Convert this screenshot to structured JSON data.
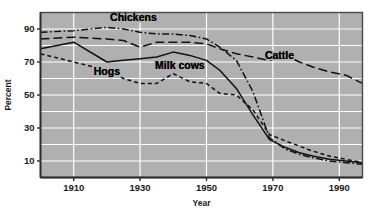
{
  "chart_data": {
    "type": "line",
    "title": "",
    "xlabel": "Year",
    "ylabel": "Percent",
    "xlim": [
      1900,
      1997
    ],
    "ylim": [
      0,
      100
    ],
    "grid": true,
    "grid_color": "#ffffff",
    "plot_background": "#b0b0b0",
    "legend": "inline-labels",
    "x_ticks": [
      "1910",
      "1930",
      "1950",
      "1970",
      "1990"
    ],
    "x_tick_values": [
      1910,
      1930,
      1950,
      1970,
      1990
    ],
    "y_ticks": [
      "10",
      "30",
      "50",
      "70",
      "90"
    ],
    "y_tick_values": [
      10,
      30,
      50,
      70,
      90
    ],
    "y_gridline_values": [
      10,
      20,
      30,
      40,
      50,
      60,
      70,
      80,
      90,
      100
    ],
    "series": [
      {
        "name": "Chickens",
        "line_style": "dash-dot",
        "color": "#111111",
        "label_x": 1928,
        "label_y": 95,
        "x": [
          1900,
          1910,
          1920,
          1925,
          1930,
          1935,
          1940,
          1945,
          1950,
          1954,
          1959,
          1964,
          1969,
          1974,
          1978,
          1982,
          1987,
          1992,
          1997
        ],
        "values": [
          88,
          89,
          91,
          90,
          88,
          87,
          87,
          86,
          84,
          79,
          71,
          52,
          24,
          17,
          14,
          12,
          10,
          9,
          8
        ]
      },
      {
        "name": "Cattle",
        "line_style": "long-dash",
        "color": "#111111",
        "label_x": 1972,
        "label_y": 72,
        "x": [
          1900,
          1910,
          1920,
          1925,
          1930,
          1935,
          1940,
          1945,
          1950,
          1954,
          1959,
          1964,
          1969,
          1974,
          1978,
          1982,
          1987,
          1992,
          1997
        ],
        "values": [
          84,
          85,
          84,
          83,
          79,
          82,
          82,
          82,
          81,
          78,
          75,
          73,
          71,
          74,
          70,
          67,
          64,
          62,
          57
        ]
      },
      {
        "name": "Milk cows",
        "line_style": "solid",
        "color": "#111111",
        "label_x": 1942,
        "label_y": 66,
        "x": [
          1900,
          1910,
          1920,
          1925,
          1930,
          1935,
          1940,
          1945,
          1950,
          1954,
          1959,
          1964,
          1969,
          1974,
          1978,
          1982,
          1987,
          1992,
          1997
        ],
        "values": [
          78,
          82,
          70,
          71,
          72,
          73,
          76,
          74,
          71,
          65,
          54,
          38,
          23,
          18,
          15,
          13,
          11,
          10,
          9
        ]
      },
      {
        "name": "Hogs",
        "line_style": "short-dash",
        "color": "#111111",
        "label_x": 1920,
        "label_y": 62,
        "x": [
          1900,
          1910,
          1920,
          1925,
          1930,
          1935,
          1940,
          1945,
          1950,
          1954,
          1959,
          1964,
          1969,
          1974,
          1978,
          1982,
          1987,
          1992,
          1997
        ],
        "values": [
          75,
          70,
          65,
          60,
          57,
          57,
          63,
          58,
          57,
          51,
          50,
          41,
          26,
          22,
          19,
          16,
          13,
          11,
          9
        ]
      }
    ]
  },
  "axis": {
    "y_title": "Percent",
    "x_title": "Year"
  }
}
